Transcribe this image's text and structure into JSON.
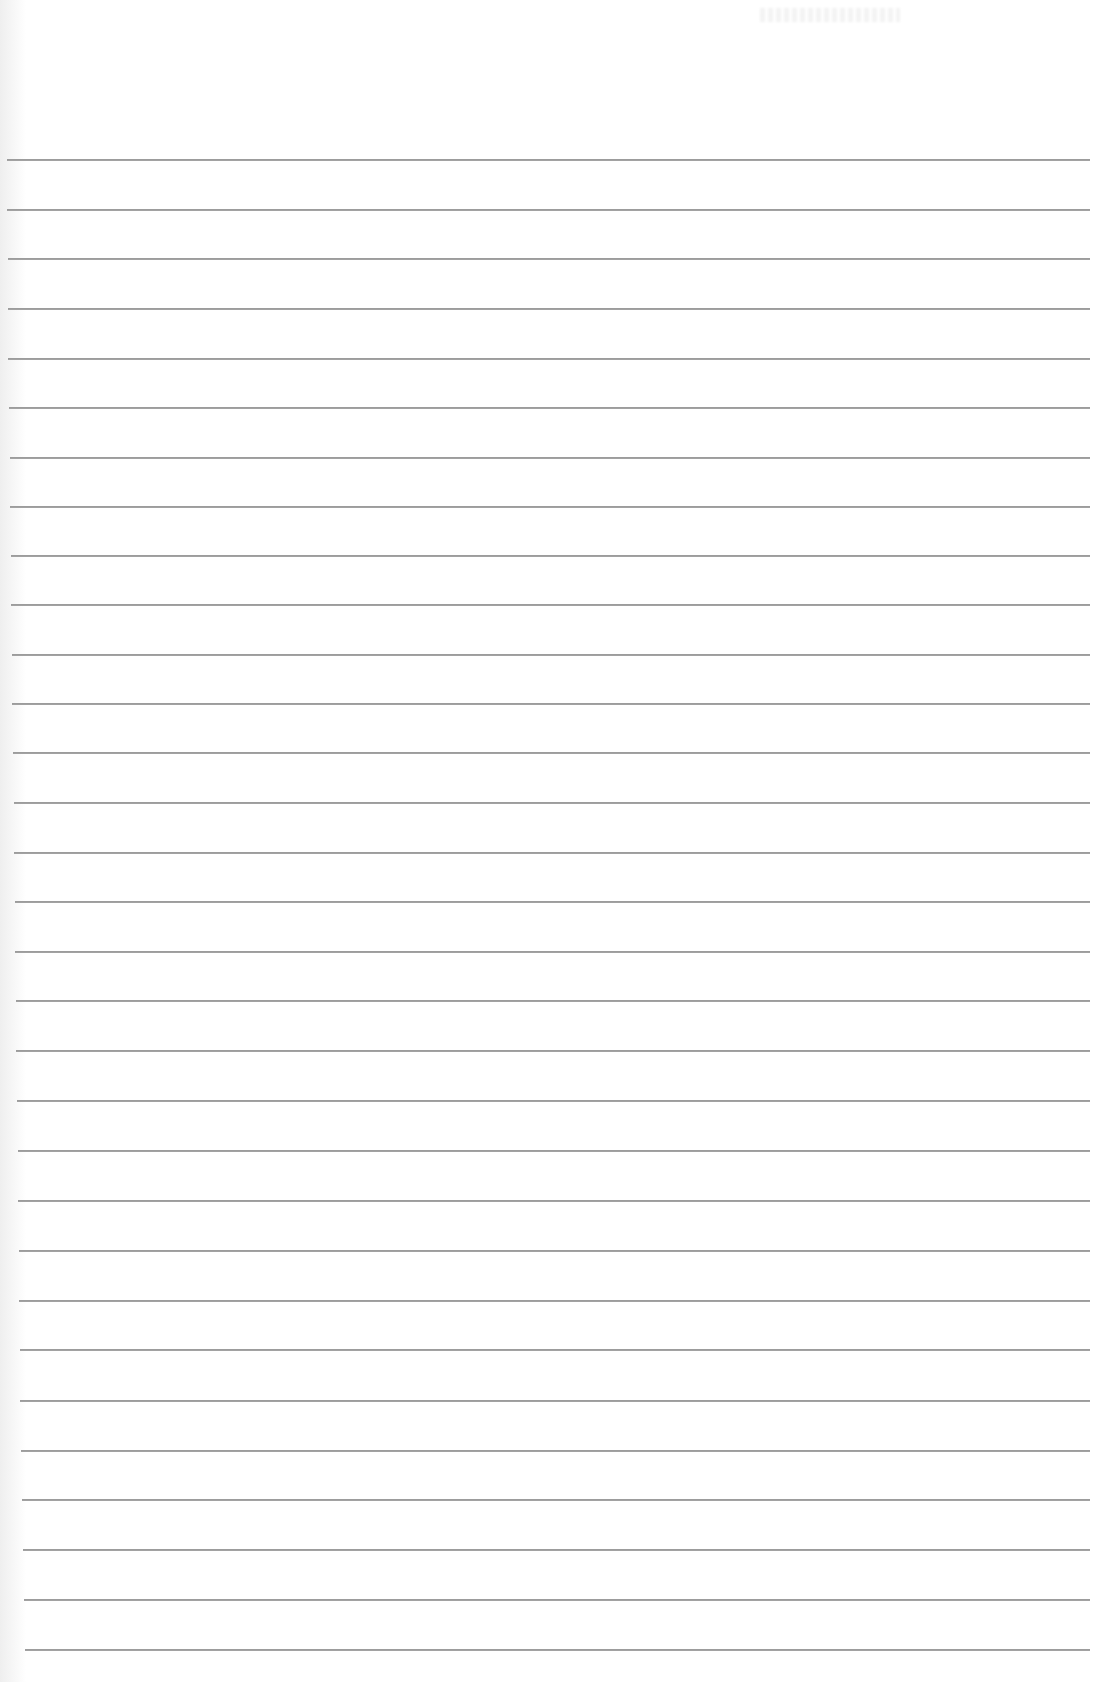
{
  "document": {
    "type": "lined-paper",
    "background_color": "#ffffff",
    "rule_color": "#9c9c9c",
    "rule_count": 31,
    "rules": [
      {
        "y": 159,
        "x1": 7,
        "x2": 1090
      },
      {
        "y": 209,
        "x1": 7,
        "x2": 1090
      },
      {
        "y": 258,
        "x1": 8,
        "x2": 1090
      },
      {
        "y": 308,
        "x1": 8,
        "x2": 1090
      },
      {
        "y": 358,
        "x1": 8,
        "x2": 1090
      },
      {
        "y": 407,
        "x1": 9,
        "x2": 1090
      },
      {
        "y": 457,
        "x1": 10,
        "x2": 1090
      },
      {
        "y": 506,
        "x1": 10,
        "x2": 1090
      },
      {
        "y": 555,
        "x1": 11,
        "x2": 1090
      },
      {
        "y": 604,
        "x1": 11,
        "x2": 1090
      },
      {
        "y": 654,
        "x1": 12,
        "x2": 1090
      },
      {
        "y": 703,
        "x1": 12,
        "x2": 1090
      },
      {
        "y": 752,
        "x1": 13,
        "x2": 1090
      },
      {
        "y": 802,
        "x1": 14,
        "x2": 1090
      },
      {
        "y": 852,
        "x1": 14,
        "x2": 1090
      },
      {
        "y": 901,
        "x1": 15,
        "x2": 1090
      },
      {
        "y": 951,
        "x1": 15,
        "x2": 1090
      },
      {
        "y": 1000,
        "x1": 16,
        "x2": 1090
      },
      {
        "y": 1050,
        "x1": 16,
        "x2": 1090
      },
      {
        "y": 1100,
        "x1": 17,
        "x2": 1090
      },
      {
        "y": 1150,
        "x1": 18,
        "x2": 1090
      },
      {
        "y": 1200,
        "x1": 18,
        "x2": 1090
      },
      {
        "y": 1250,
        "x1": 19,
        "x2": 1090
      },
      {
        "y": 1300,
        "x1": 19,
        "x2": 1090
      },
      {
        "y": 1349,
        "x1": 20,
        "x2": 1090
      },
      {
        "y": 1400,
        "x1": 20,
        "x2": 1090
      },
      {
        "y": 1450,
        "x1": 21,
        "x2": 1090
      },
      {
        "y": 1499,
        "x1": 22,
        "x2": 1090
      },
      {
        "y": 1549,
        "x1": 23,
        "x2": 1090
      },
      {
        "y": 1599,
        "x1": 24,
        "x2": 1090
      },
      {
        "y": 1649,
        "x1": 25,
        "x2": 1090
      }
    ]
  }
}
